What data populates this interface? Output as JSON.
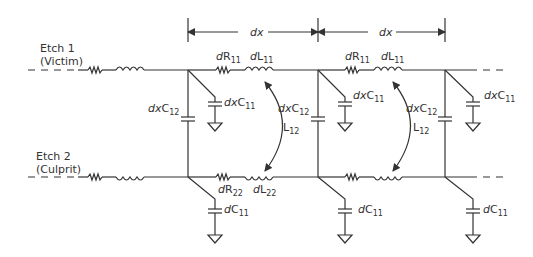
{
  "diagram": {
    "nets": {
      "etch1": {
        "name": "Etch 1",
        "role": "(Victim)"
      },
      "etch2": {
        "name": "Etch 2",
        "role": "(Culprit)"
      }
    },
    "dimension": {
      "segment1_label": "dx",
      "segment2_label": "dx"
    },
    "labels": {
      "dR11_a": {
        "pre": "d",
        "main": "R",
        "sub": "11"
      },
      "dL11_a": {
        "pre": "d",
        "main": "L",
        "sub": "11"
      },
      "dR11_b": {
        "pre": "d",
        "main": "R",
        "sub": "11"
      },
      "dL11_b": {
        "pre": "d",
        "main": "L",
        "sub": "11"
      },
      "dR22": {
        "pre": "d",
        "main": "R",
        "sub": "22"
      },
      "dL22": {
        "pre": "d",
        "main": "L",
        "sub": "22"
      },
      "L12_a": {
        "main": "L",
        "sub": "12"
      },
      "L12_b": {
        "main": "L",
        "sub": "12"
      },
      "dxC12_a": {
        "pre": "dx",
        "main": "C",
        "sub": "12"
      },
      "dxC12_b": {
        "pre": "dx",
        "main": "C",
        "sub": "12"
      },
      "dxC12_c": {
        "pre": "dx",
        "main": "C",
        "sub": "12"
      },
      "dxC11_a": {
        "pre": "dx",
        "main": "C",
        "sub": "11"
      },
      "dxC11_b": {
        "pre": "dx",
        "main": "C",
        "sub": "11"
      },
      "dxC11_c": {
        "pre": "dx",
        "main": "C",
        "sub": "11"
      },
      "dC11_a": {
        "pre": "d",
        "main": "C",
        "sub": "11"
      },
      "dC11_b": {
        "pre": "d",
        "main": "C",
        "sub": "11"
      },
      "dC11_c": {
        "pre": "d",
        "main": "C",
        "sub": "11"
      }
    },
    "colors": {
      "line": "#333333",
      "background": "#ffffff"
    }
  }
}
